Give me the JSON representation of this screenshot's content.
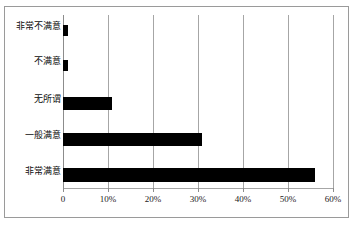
{
  "chart_data": {
    "type": "bar",
    "orientation": "horizontal",
    "title": "",
    "subtitle": "",
    "xlabel": "",
    "ylabel": "",
    "categories": [
      "非常不满意",
      "不满意",
      "无所谓",
      "一般满意",
      "非常满意"
    ],
    "values": [
      1,
      1,
      10.8,
      30.8,
      56
    ],
    "value_suffix": "%",
    "xlim": [
      0,
      60
    ],
    "xticks": [
      0,
      10,
      20,
      30,
      40,
      50,
      60
    ],
    "xtick_labels": [
      "0",
      "10%",
      "20%",
      "30%",
      "40%",
      "50%",
      "60%"
    ],
    "grid": true,
    "grid_axis": "x",
    "legend": false,
    "legend_position": "none",
    "series": [
      {
        "name": "满意度比例",
        "color": "#000000",
        "values": [
          1,
          1,
          10.8,
          30.8,
          56
        ]
      }
    ],
    "annotations": []
  },
  "figure": {
    "background_color": "#ffffff",
    "frame_color": "#9a9a9a",
    "grid_color": "#a6a6a6",
    "bar_color": "#000000",
    "text_color": "#0d0d0d"
  }
}
